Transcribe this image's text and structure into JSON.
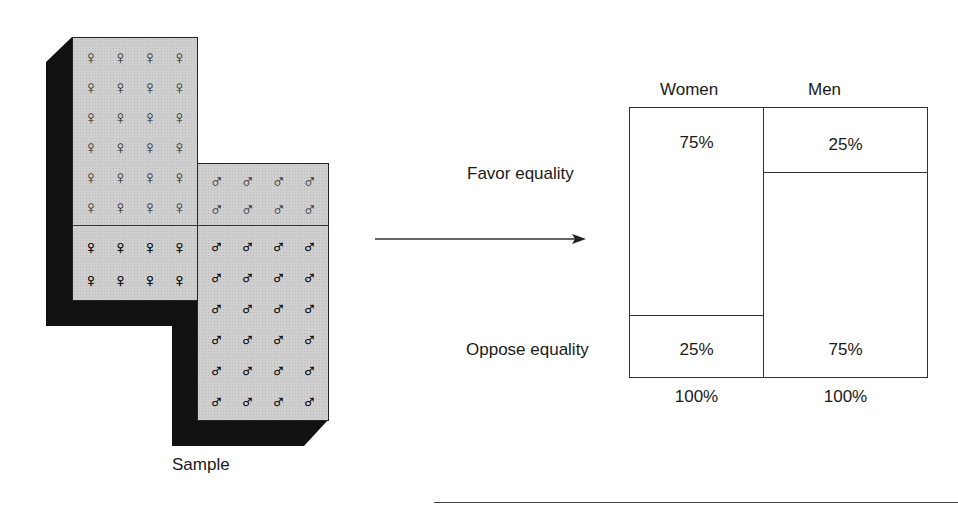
{
  "figure": {
    "sample_label": "Sample",
    "sample": {
      "women": {
        "favor_count": 24,
        "oppose_count": 8,
        "favor_symbol": "♀",
        "oppose_symbol": "♀",
        "favor_icon": "female-open-icon",
        "oppose_icon": "female-filled-icon"
      },
      "men": {
        "favor_count": 8,
        "oppose_count": 24,
        "favor_symbol": "♂",
        "oppose_symbol": "♂",
        "favor_icon": "male-open-icon",
        "oppose_icon": "male-filled-icon"
      }
    },
    "arrow_icon": "arrow-right-icon",
    "table": {
      "columns": [
        "Women",
        "Men"
      ],
      "rows": [
        "Favor equality",
        "Oppose equality"
      ],
      "cells": {
        "women_favor": "75%",
        "men_favor": "25%",
        "women_oppose": "25%",
        "men_oppose": "75%"
      },
      "totals": [
        "100%",
        "100%"
      ]
    },
    "colors": {
      "panel_fill": "#cfcfcf",
      "shadow": "#111111",
      "line": "#333333"
    }
  }
}
